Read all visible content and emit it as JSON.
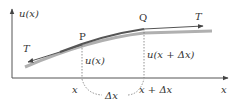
{
  "diagram": {
    "y_axis_label": "u(x)",
    "x_axis_label": "x",
    "point_p_label": "P",
    "point_q_label": "Q",
    "tension_right_label": "T",
    "tension_left_label": "T",
    "displacement_p_label": "u(x)",
    "displacement_q_label": "u(x + Δx)",
    "x_left_label": "x",
    "x_right_label": "x + Δx",
    "delta_label": "Δx",
    "colors": {
      "axis": "#444444",
      "curve": "#555555",
      "segment_shadow": "#a9a9a9",
      "text": "#333333"
    }
  }
}
